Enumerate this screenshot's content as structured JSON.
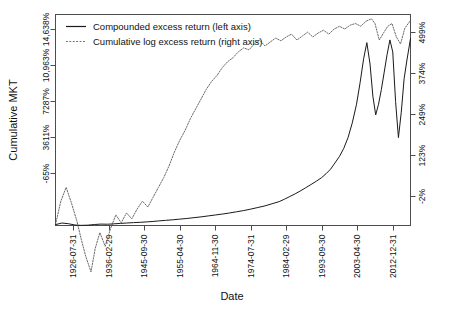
{
  "chart_data": {
    "type": "line",
    "title": "",
    "xlabel": "Date",
    "ylabel": "Cumulative MKT",
    "grid": false,
    "legend_position": "top-left inside",
    "x_tick_labels": [
      "1926-07-31",
      "1936-02-29",
      "1945-09-30",
      "1955-04-30",
      "1964-11-30",
      "1974-07-31",
      "1984-02-29",
      "1993-09-30",
      "2003-04-30",
      "2012-12-31"
    ],
    "y_left_axis": {
      "label": "Cumulative MKT",
      "tick_labels": [
        "-65%",
        "3611%",
        "7287%",
        "10,963%",
        "14,638%"
      ],
      "tick_values": [
        -65,
        3611,
        7287,
        10963,
        14638
      ],
      "ylim": [
        -65,
        15700
      ]
    },
    "y_right_axis": {
      "tick_labels": [
        "-2%",
        "123%",
        "249%",
        "374%",
        "499%"
      ],
      "tick_values": [
        -2,
        123,
        249,
        374,
        499
      ],
      "ylim": [
        -2,
        535
      ]
    },
    "series": [
      {
        "name": "Compounded excess return (left axis)",
        "style": "solid",
        "axis": "left",
        "color": "#1a1a1a",
        "x": [
          0,
          0.018,
          0.036,
          0.055,
          0.073,
          0.091,
          0.11,
          0.128,
          0.146,
          0.164,
          0.183,
          0.2,
          0.22,
          0.24,
          0.26,
          0.275,
          0.29,
          0.31,
          0.33,
          0.35,
          0.37,
          0.39,
          0.41,
          0.43,
          0.45,
          0.47,
          0.49,
          0.51,
          0.53,
          0.55,
          0.57,
          0.59,
          0.61,
          0.63,
          0.645,
          0.66,
          0.675,
          0.69,
          0.705,
          0.72,
          0.735,
          0.75,
          0.762,
          0.775,
          0.787,
          0.8,
          0.812,
          0.824,
          0.836,
          0.848,
          0.858,
          0.868,
          0.877,
          0.886,
          0.894,
          0.902,
          0.91,
          0.918,
          0.926,
          0.934,
          0.942,
          0.95,
          0.958,
          0.966,
          0.974,
          0.982,
          0.99,
          1.0
        ],
        "values": [
          0,
          120,
          70,
          -30,
          -55,
          -40,
          10,
          40,
          30,
          60,
          90,
          120,
          150,
          175,
          210,
          240,
          275,
          320,
          360,
          410,
          460,
          520,
          580,
          650,
          720,
          790,
          870,
          960,
          1050,
          1160,
          1280,
          1400,
          1560,
          1720,
          1900,
          2100,
          2300,
          2520,
          2760,
          3000,
          3250,
          3520,
          3800,
          4150,
          4600,
          5100,
          5700,
          6500,
          7600,
          9000,
          10600,
          12400,
          13600,
          12000,
          9600,
          8200,
          9000,
          10100,
          11400,
          12700,
          13800,
          12900,
          9200,
          6500,
          8400,
          10900,
          12300,
          13900
        ]
      },
      {
        "name": "Cumulative log excess return (right axis)",
        "style": "dotted",
        "axis": "right",
        "color": "#6b6b6b",
        "x": [
          0,
          0.015,
          0.03,
          0.045,
          0.06,
          0.072,
          0.085,
          0.1,
          0.112,
          0.125,
          0.14,
          0.155,
          0.17,
          0.185,
          0.2,
          0.215,
          0.23,
          0.245,
          0.26,
          0.275,
          0.29,
          0.305,
          0.32,
          0.335,
          0.35,
          0.365,
          0.38,
          0.395,
          0.41,
          0.425,
          0.44,
          0.455,
          0.47,
          0.485,
          0.5,
          0.515,
          0.53,
          0.545,
          0.56,
          0.575,
          0.59,
          0.605,
          0.62,
          0.635,
          0.65,
          0.665,
          0.68,
          0.695,
          0.71,
          0.725,
          0.74,
          0.755,
          0.77,
          0.785,
          0.8,
          0.815,
          0.83,
          0.845,
          0.86,
          0.875,
          0.89,
          0.9,
          0.912,
          0.924,
          0.936,
          0.948,
          0.96,
          0.972,
          0.984,
          1.0
        ],
        "values": [
          0,
          60,
          95,
          55,
          10,
          -35,
          -80,
          -120,
          -60,
          -20,
          -55,
          -10,
          25,
          5,
          30,
          15,
          40,
          60,
          45,
          70,
          95,
          120,
          150,
          185,
          215,
          240,
          270,
          295,
          320,
          345,
          365,
          380,
          400,
          415,
          425,
          440,
          450,
          445,
          460,
          470,
          455,
          465,
          475,
          468,
          478,
          485,
          470,
          480,
          490,
          478,
          488,
          495,
          485,
          498,
          505,
          498,
          508,
          512,
          505,
          518,
          524,
          512,
          470,
          488,
          505,
          512,
          478,
          460,
          500,
          520
        ]
      }
    ]
  },
  "legend": {
    "items": [
      {
        "label": "Compounded excess return (left axis)",
        "style": "solid"
      },
      {
        "label": "Cumulative log excess return (right axis)",
        "style": "dotted"
      }
    ]
  }
}
